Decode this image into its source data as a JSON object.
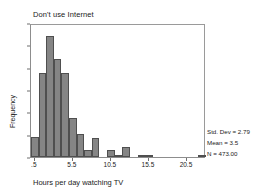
{
  "chart_data": {
    "type": "bar",
    "title": "Don't use Internet",
    "xlabel": "Hours per day watching TV",
    "ylabel": "Frequency",
    "ylim": [
      0,
      120
    ],
    "xlim": [
      0,
      23
    ],
    "grid": false,
    "legend": "none",
    "bin_width": 1,
    "bar_color": "#858585",
    "bar_edge_color": "#4f4f4f",
    "xticks": [
      {
        "value": 0.5,
        "label": ".5"
      },
      {
        "value": 5.5,
        "label": "5.5"
      },
      {
        "value": 10.5,
        "label": "10.5"
      },
      {
        "value": 15.5,
        "label": "15.5"
      },
      {
        "value": 20.5,
        "label": "20.5"
      }
    ],
    "yticks": [
      {
        "value": 0,
        "label": "0"
      },
      {
        "value": 20,
        "label": "20"
      },
      {
        "value": 40,
        "label": "40"
      },
      {
        "value": 60,
        "label": "60"
      },
      {
        "value": 80,
        "label": "80"
      },
      {
        "value": 100,
        "label": "100"
      },
      {
        "value": 120,
        "label": "120"
      }
    ],
    "bins": [
      {
        "x": 0.5,
        "value": 18
      },
      {
        "x": 1.5,
        "value": 75
      },
      {
        "x": 2.5,
        "value": 108
      },
      {
        "x": 3.5,
        "value": 88
      },
      {
        "x": 4.5,
        "value": 75
      },
      {
        "x": 5.5,
        "value": 35
      },
      {
        "x": 6.5,
        "value": 21
      },
      {
        "x": 7.5,
        "value": 6
      },
      {
        "x": 8.5,
        "value": 17
      },
      {
        "x": 9.5,
        "value": 0
      },
      {
        "x": 10.5,
        "value": 6
      },
      {
        "x": 11.5,
        "value": 1
      },
      {
        "x": 12.5,
        "value": 9
      },
      {
        "x": 13.5,
        "value": 0
      },
      {
        "x": 14.5,
        "value": 2
      },
      {
        "x": 15.5,
        "value": 1
      },
      {
        "x": 16.5,
        "value": 0
      },
      {
        "x": 17.5,
        "value": 0
      },
      {
        "x": 18.5,
        "value": 0
      },
      {
        "x": 19.5,
        "value": 0
      },
      {
        "x": 20.5,
        "value": 0
      },
      {
        "x": 21.5,
        "value": 0
      },
      {
        "x": 22.5,
        "value": 1
      }
    ],
    "annotations": {
      "std_dev": "Std. Dev = 2.79",
      "mean": "Mean = 3.5",
      "n": "N = 473.00"
    }
  }
}
